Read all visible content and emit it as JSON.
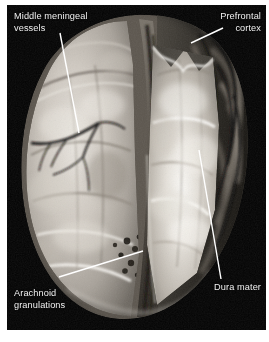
{
  "figure": {
    "kind": "anatomical-photograph",
    "background_color": "#ffffff",
    "plate_color": "#050505",
    "label_color": "#f2f2f2",
    "leader_color": "#ffffff"
  },
  "labels": [
    {
      "id": "middle-meningeal-vessels",
      "text": "Middle meningeal\nvessels",
      "align": "left",
      "leader": {
        "x1": 60,
        "y1": 33,
        "x2": 79,
        "y2": 133
      }
    },
    {
      "id": "prefrontal-cortex",
      "text": "Prefrontal\ncortex",
      "align": "right",
      "leader": {
        "x1": 223,
        "y1": 28,
        "x2": 191,
        "y2": 43
      }
    },
    {
      "id": "arachnoid-granulations",
      "text": "Arachnoid\ngranulations",
      "align": "left",
      "leader": {
        "x1": 59,
        "y1": 277,
        "x2": 143,
        "y2": 251
      }
    },
    {
      "id": "dura-mater",
      "text": "Dura mater",
      "align": "right",
      "leader": {
        "x1": 221,
        "y1": 279,
        "x2": 199,
        "y2": 150
      }
    }
  ]
}
